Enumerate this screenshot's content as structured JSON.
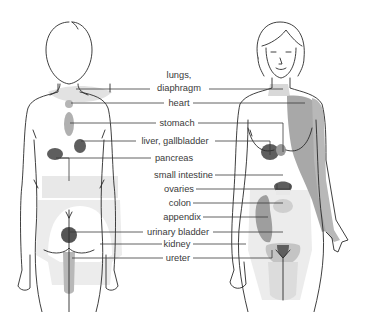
{
  "diagram": {
    "figures": [
      {
        "name": "back-view-figure",
        "description": "male figure, posterior view"
      },
      {
        "name": "front-view-figure",
        "description": "female figure, anterior view"
      }
    ],
    "labels": [
      {
        "id": "lungs-diaphragm",
        "lines": [
          "lungs,",
          "diaphragm"
        ]
      },
      {
        "id": "heart",
        "lines": [
          "heart"
        ]
      },
      {
        "id": "stomach",
        "lines": [
          "stomach"
        ]
      },
      {
        "id": "liver-gallbladder",
        "lines": [
          "liver, gallbladder"
        ]
      },
      {
        "id": "pancreas",
        "lines": [
          "pancreas"
        ]
      },
      {
        "id": "small-intestine",
        "lines": [
          "small intestine"
        ]
      },
      {
        "id": "ovaries",
        "lines": [
          "ovaries"
        ]
      },
      {
        "id": "colon",
        "lines": [
          "colon"
        ]
      },
      {
        "id": "appendix",
        "lines": [
          "appendix"
        ]
      },
      {
        "id": "urinary-bladder",
        "lines": [
          "urinary bladder"
        ]
      },
      {
        "id": "kidney",
        "lines": [
          "kidney"
        ]
      },
      {
        "id": "ureter",
        "lines": [
          "ureter"
        ]
      }
    ],
    "colors": {
      "outline": "#2a2a2a",
      "very_light_zone": "#ececec",
      "light_zone": "#dedede",
      "medium_zone": "#b5b5b5",
      "mid_dark_zone": "#9a9a9a",
      "dark_zone": "#5e5e5e",
      "text": "#3a3a3a"
    }
  }
}
